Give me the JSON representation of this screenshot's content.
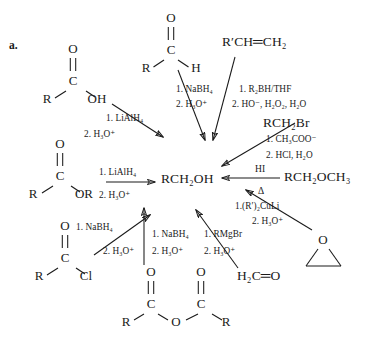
{
  "panel": {
    "letter": "a."
  },
  "central_product": {
    "label": "RCH₂OH"
  },
  "reactants": [
    {
      "id": "carboxylic-acid",
      "name": "carboxylic-acid-structure",
      "r_label": "R",
      "carbonyl_c": "C",
      "carbonyl_o": "O",
      "right_group": "OH"
    },
    {
      "id": "aldehyde",
      "name": "aldehyde-structure",
      "r_label": "R",
      "carbonyl_c": "C",
      "carbonyl_o": "O",
      "right_group": "H"
    },
    {
      "id": "alkene",
      "name": "alkene-formula",
      "formula": "R′CH═CH₂"
    },
    {
      "id": "ester",
      "name": "ester-structure",
      "r_label": "R",
      "carbonyl_c": "C",
      "carbonyl_o": "O",
      "right_group": "OR"
    },
    {
      "id": "acid-chloride",
      "name": "acid-chloride-structure",
      "r_label": "R",
      "carbonyl_c": "C",
      "carbonyl_o": "O",
      "right_group": "Cl"
    },
    {
      "id": "anhydride",
      "name": "anhydride-structure",
      "left_r": "R",
      "left_c": "C",
      "left_o": "O",
      "bridge_o": "O",
      "right_c": "C",
      "right_o": "O",
      "right_r": "R"
    },
    {
      "id": "alkyl-bromide",
      "name": "alkyl-bromide-formula",
      "formula": "RCH₂Br"
    },
    {
      "id": "methyl-ether",
      "name": "methyl-ether-formula",
      "formula": "RCH₂OCH₃"
    },
    {
      "id": "formaldehyde",
      "name": "formaldehyde-formula",
      "formula": "H₂C═O"
    },
    {
      "id": "epoxide",
      "name": "epoxide-structure",
      "o_label": "O"
    }
  ],
  "reagents": {
    "from_acid": {
      "step1": "1. LiAlH₄",
      "step2": "2. H₃O⁺"
    },
    "from_aldehyde": {
      "step1": "1. NaBH₄",
      "step2": "2. H₃O⁺"
    },
    "from_alkene": {
      "step1": "1. R₂BH/THF",
      "step2": "2. HO⁻, H₂O₂, H₂O"
    },
    "from_ester": {
      "step1": "1. LiAlH₄",
      "step2": "2. H₃O⁺"
    },
    "from_bromide": {
      "step1": "1. CH₃COO⁻",
      "step2": "2. HCl, H₂O"
    },
    "from_ether": {
      "above": "HI",
      "below": "Δ"
    },
    "from_acid_chloride": {
      "step1": "1. NaBH₄",
      "step2": "2. H₃O⁺"
    },
    "from_anhydride": {
      "step1": "1. NaBH₄",
      "step2": "2. H₃O⁺"
    },
    "from_epoxide": {
      "step1": "1.(R′)₂CuLi",
      "step2": "2. H₃O⁺"
    },
    "from_formaldehyde": {
      "step1": "1. RMgBr",
      "step2": "2. H₃O⁺"
    }
  },
  "colors": {
    "ink": "#1a1a1a",
    "background": "#ffffff"
  }
}
